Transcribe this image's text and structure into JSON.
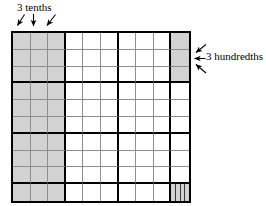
{
  "figure": {
    "type": "decimal-place-value-grid",
    "grid": {
      "rows": 10,
      "columns": 10,
      "heavy_line_after_column": [
        3,
        6,
        9
      ],
      "heavy_line_after_row": [
        3,
        6,
        9
      ],
      "shaded_color": "#d2d2d2",
      "line_color": "#8e8e8e",
      "heavy_line_color": "#000000",
      "border_color": "#000000"
    },
    "shaded_regions": [
      {
        "name": "tenths",
        "description": "first three full columns shaded",
        "columns": [
          1,
          2,
          3
        ],
        "rows": [
          1,
          2,
          3,
          4,
          5,
          6,
          7,
          8,
          9,
          10
        ],
        "count": 30,
        "value": "0.3"
      },
      {
        "name": "hundredths",
        "description": "top three cells of the last column shaded",
        "columns": [
          10
        ],
        "rows": [
          1,
          2,
          3
        ],
        "count": 3,
        "value": "0.03"
      },
      {
        "name": "thousandths",
        "description": "bottom-right cell divided into vertical strips",
        "columns": [
          10
        ],
        "rows": [
          10
        ],
        "strips": 4,
        "value": "0.004"
      }
    ],
    "labels": {
      "tenths": {
        "text": "3 tenths",
        "arrows": 3,
        "arrow_directions": [
          "down-left",
          "down",
          "down-left"
        ],
        "points_to": "first three columns"
      },
      "hundredths": {
        "text": "3 hundredths",
        "arrows": 3,
        "arrow_directions": [
          "down-left",
          "left",
          "up-left"
        ],
        "points_to": "top three cells of last column"
      }
    }
  }
}
